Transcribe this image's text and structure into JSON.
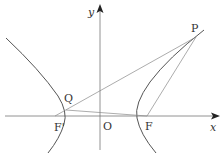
{
  "diagram": {
    "type": "hyperbola-focal-diagram",
    "axes": {
      "x_label": "x",
      "y_label": "y",
      "origin_label": "O"
    },
    "points": {
      "P": {
        "label": "P"
      },
      "Q": {
        "label": "Q"
      },
      "F": {
        "label": "F"
      },
      "F_prime": {
        "label": "F'"
      }
    },
    "segments": [
      "F'P",
      "PF",
      "QF"
    ],
    "curves": [
      "left-branch",
      "right-branch"
    ],
    "colors": {
      "curve": "#555555",
      "line": "#888888",
      "axis": "#777777",
      "text": "#333333"
    }
  }
}
